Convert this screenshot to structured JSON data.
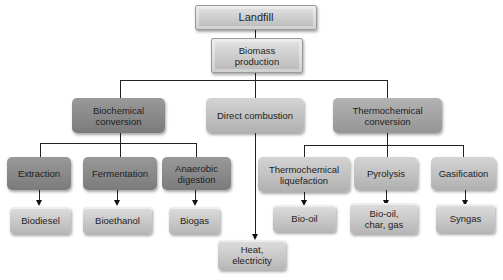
{
  "diagram": {
    "root": "Landfill",
    "level1": "Biomass production",
    "categories": [
      {
        "label": "Biochemical conversion",
        "processes": [
          {
            "label": "Extraction",
            "product": "Biodiesel"
          },
          {
            "label": "Fermentation",
            "product": "Bioethanol"
          },
          {
            "label": "Anaerobic digestion",
            "product": "Biogas"
          }
        ]
      },
      {
        "label": "Direct combustion",
        "product": "Heat, electricity"
      },
      {
        "label": "Thermochemical conversion",
        "processes": [
          {
            "label": "Thermochemical liquefaction",
            "product": "Bio-oil"
          },
          {
            "label": "Pyrolysis",
            "product": "Bio-oil, char, gas"
          },
          {
            "label": "Gasification",
            "product": "Syngas"
          }
        ]
      }
    ]
  },
  "colors": {
    "dark_box": "#8a8a8a",
    "mid_box": "#a5a5a5",
    "light_box": "#c4c4c4",
    "line": "#222222"
  }
}
